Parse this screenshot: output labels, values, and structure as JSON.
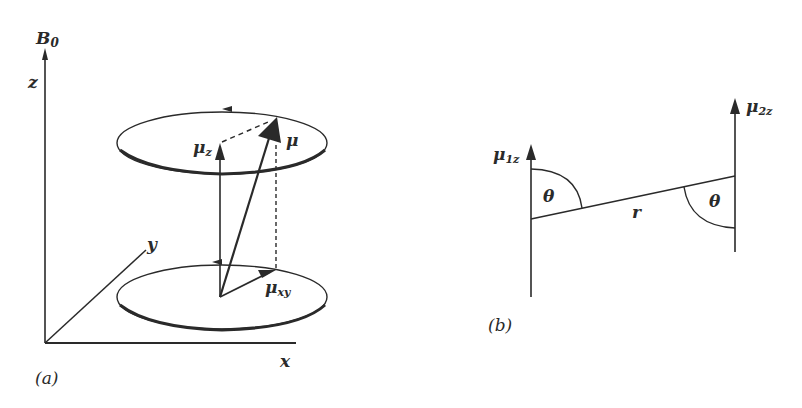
{
  "figure": {
    "panel_a": {
      "label": "(a)",
      "field_label": "B",
      "field_subscript": "0",
      "axes": {
        "z": "z",
        "x": "x",
        "y": "y"
      },
      "vectors": {
        "mu": "μ",
        "mu_z": {
          "base": "μ",
          "sub": "z"
        },
        "mu_xy": {
          "base": "μ",
          "sub": "xy"
        }
      }
    },
    "panel_b": {
      "label": "(b)",
      "mu1z": {
        "base": "μ",
        "sub": "1z"
      },
      "mu2z": {
        "base": "μ",
        "sub": "2z"
      },
      "distance": "r",
      "angle_left": "θ",
      "angle_right": "θ"
    },
    "colors": {
      "ink": "#2a2a2a",
      "background": "#ffffff"
    }
  }
}
